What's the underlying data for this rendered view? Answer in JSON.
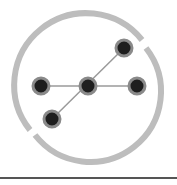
{
  "logo": {
    "icon": "network-graph-icon",
    "ring_color": "#bdbdbd",
    "node_color": "#1e1e1e",
    "node_border": "#8a8a8a",
    "edge_color": "#9a9a9a",
    "nodes": [
      {
        "id": "left",
        "x": 41,
        "y": 86
      },
      {
        "id": "center",
        "x": 88,
        "y": 86
      },
      {
        "id": "right",
        "x": 137,
        "y": 86
      },
      {
        "id": "top-right",
        "x": 124,
        "y": 48
      },
      {
        "id": "bottom-left",
        "x": 52,
        "y": 119
      }
    ]
  },
  "divider": {
    "color": "#555555"
  }
}
